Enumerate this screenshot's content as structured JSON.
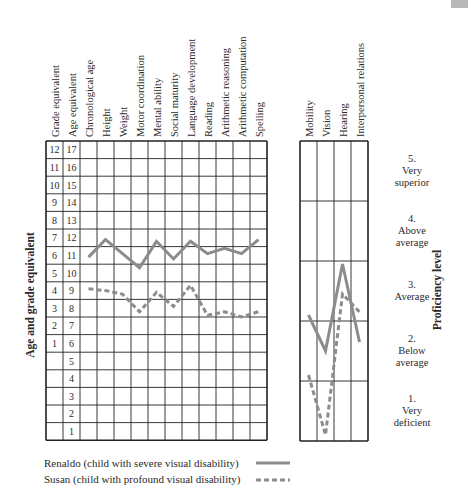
{
  "chart_data": [
    {
      "type": "line",
      "title": "",
      "ylabel": "Age and grade equivalent",
      "xlabel": "",
      "categories": [
        "Chronological age",
        "Height",
        "Weight",
        "Motor coordination",
        "Mental ability",
        "Social maturity",
        "Language development",
        "Reading",
        "Arithmetic reasoning",
        "Arithmetic computation",
        "Spelling"
      ],
      "scale_columns": [
        {
          "header": "Grade equivalent",
          "ticks": [
            "12",
            "11",
            "10",
            "9",
            "8",
            "7",
            "6",
            "5",
            "4",
            "3",
            "2",
            "1",
            "",
            "",
            "",
            "",
            ""
          ]
        },
        {
          "header": "Age equivalent",
          "ticks": [
            "17",
            "16",
            "15",
            "14",
            "13",
            "12",
            "11",
            "10",
            "9",
            "8",
            "7",
            "6",
            "5",
            "4",
            "3",
            "2",
            "1"
          ]
        }
      ],
      "ylim": [
        1,
        17
      ],
      "grid": true,
      "series": [
        {
          "name": "Renaldo",
          "style": "solid",
          "color": "#8c8c8c",
          "values": [
            10.9,
            11.9,
            11.1,
            10.3,
            11.8,
            10.8,
            11.8,
            11.1,
            11.4,
            11.1,
            11.9
          ]
        },
        {
          "name": "Susan",
          "style": "dashed",
          "color": "#8c8c8c",
          "values": [
            9.1,
            9.0,
            8.8,
            7.8,
            8.9,
            8.1,
            9.3,
            7.6,
            7.8,
            7.5,
            7.8
          ]
        }
      ]
    },
    {
      "type": "line",
      "title": "",
      "ylabel": "Proficiency level",
      "categories": [
        "Mobility",
        "Vision",
        "Hearing",
        "Interpersonal relations"
      ],
      "levels": [
        {
          "number": "5.",
          "line1": "Very",
          "line2": "superior"
        },
        {
          "number": "4.",
          "line1": "Above",
          "line2": "average"
        },
        {
          "number": "3.",
          "line1": "Average",
          "line2": ""
        },
        {
          "number": "2.",
          "line1": "Below",
          "line2": "average"
        },
        {
          "number": "1.",
          "line1": "Very",
          "line2": "deficient"
        }
      ],
      "ylim": [
        0,
        5
      ],
      "grid": true,
      "series": [
        {
          "name": "Renaldo",
          "style": "solid",
          "color": "#8c8c8c",
          "values": [
            2.1,
            1.5,
            2.95,
            1.65
          ]
        },
        {
          "name": "Susan",
          "style": "dashed",
          "color": "#8c8c8c",
          "values": [
            1.1,
            0.1,
            2.45,
            2.15
          ]
        }
      ]
    }
  ],
  "legend": [
    {
      "label": "Renaldo  (child with severe visual disability)",
      "style": "solid"
    },
    {
      "label": "Susan  (child with profound visual disability)",
      "style": "dashed"
    }
  ]
}
